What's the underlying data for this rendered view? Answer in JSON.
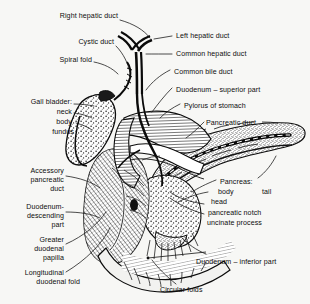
{
  "figure": {
    "style": "line engraving / hatched medical illustration",
    "background_color": "#f7f7f5",
    "ink_color": "#111111"
  },
  "labels": {
    "right_hepatic_duct": "Right hepatic duct",
    "cystic_duct": "Cystic duct",
    "spiral_fold": "Spiral fold",
    "gall_bladder": "Gall bladder:",
    "gall_bladder_neck": "neck",
    "gall_bladder_body": "body",
    "gall_bladder_fundus": "fundus",
    "accessory_pancreatic_duct_l1": "Accessory",
    "accessory_pancreatic_duct_l2": "pancreatic",
    "accessory_pancreatic_duct_l3": "duct",
    "duodenum_descending_l1": "Duodenum-",
    "duodenum_descending_l2": "descending",
    "duodenum_descending_l3": "part",
    "greater_duodenal_papilla_l1": "Greater",
    "greater_duodenal_papilla_l2": "duodenal",
    "greater_duodenal_papilla_l3": "papilla",
    "longitudinal_duodenal_fold_l1": "Longitudinal",
    "longitudinal_duodenal_fold_l2": "duodenal fold",
    "left_hepatic_duct": "Left hepatic duct",
    "common_hepatic_duct": "Common hepatic duct",
    "common_bile_duct": "Common bile duct",
    "duodenum_superior_part": "Duodenum – superior part",
    "pylorus_of_stomach": "Pylorus of stomach",
    "pancreatic_duct": "Pancreatic duct",
    "pancreas": "Pancreas:",
    "pancreas_body": "body",
    "pancreas_tail": "tail",
    "pancreas_head": "head",
    "pancreatic_notch": "pancreatic notch",
    "uncinate_process": "uncinate process",
    "duodenum_inferior_part": "Duodenum – inferior part",
    "circular_folds": "Circular folds"
  }
}
